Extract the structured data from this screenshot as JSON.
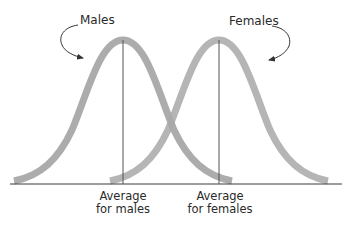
{
  "diagram": {
    "type": "overlapping-normal-distributions",
    "series": [
      {
        "name": "Males",
        "mean_x": 123,
        "label": "Males",
        "average_label_line1": "Average",
        "average_label_line2": "for males"
      },
      {
        "name": "Females",
        "mean_x": 219,
        "label": "Females",
        "average_label_line1": "Average",
        "average_label_line2": "for females"
      }
    ],
    "colors": {
      "curve": "#a8a8a8",
      "overlap": "#8a8a8a",
      "axis": "#3a3a3a",
      "mean_line": "#555555",
      "text": "#2a2a2a",
      "arrow": "#333333"
    }
  }
}
